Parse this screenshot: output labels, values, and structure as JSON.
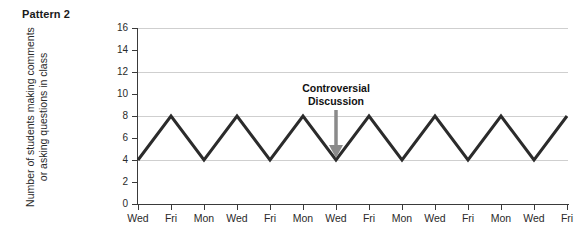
{
  "figure": {
    "panel_label": "Pattern 2"
  },
  "chart_data": {
    "type": "line",
    "title": "Pattern 2",
    "xlabel": "",
    "ylabel": "Number of students making comments or asking questions in class",
    "ylabel_lines": [
      "Number of students making comments",
      "or asking questions in class"
    ],
    "categories": [
      "Wed",
      "Fri",
      "Mon",
      "Wed",
      "Fri",
      "Mon",
      "Wed",
      "Fri",
      "Mon",
      "Wed",
      "Fri",
      "Mon",
      "Wed",
      "Fri"
    ],
    "values": [
      4,
      8,
      4,
      8,
      4,
      8,
      4,
      8,
      4,
      8,
      4,
      8,
      4,
      8
    ],
    "series": [
      {
        "name": "Number of students making comments or asking questions in class",
        "values": [
          4,
          8,
          4,
          8,
          4,
          8,
          4,
          8,
          4,
          8,
          4,
          8,
          4,
          8
        ],
        "color": "#2b2b2b"
      }
    ],
    "ylim": [
      0,
      16
    ],
    "yticks": [
      0,
      2,
      4,
      6,
      8,
      10,
      12,
      14,
      16
    ],
    "ytick_labels": [
      "0",
      "2",
      "4",
      "6",
      "8",
      "10",
      "12",
      "14",
      "16"
    ],
    "gridlines_at": [
      4,
      8,
      12,
      16
    ],
    "grid": true,
    "grid_color": "#cfcfcf",
    "legend": null,
    "legend_position": "none",
    "annotations": [
      {
        "text": "Controversial Discussion",
        "lines": [
          "Controversial",
          "Discussion"
        ],
        "target_category_index": 6,
        "target_category": "Wed",
        "target_value": 4,
        "arrow": "down-arrow",
        "arrow_color": "#8a8a8a"
      }
    ]
  }
}
